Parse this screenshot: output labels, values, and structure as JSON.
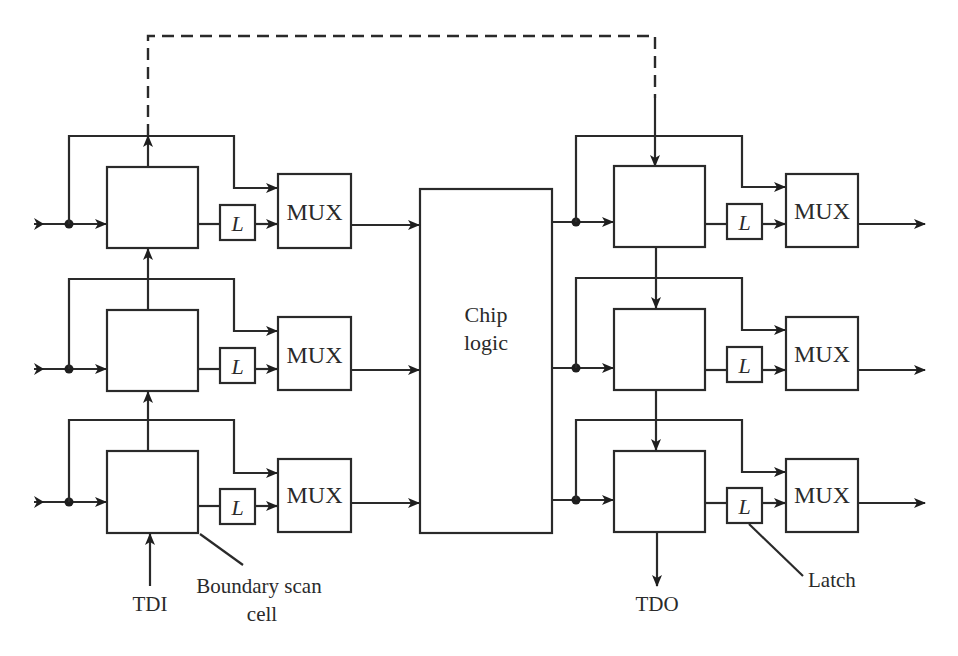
{
  "diagram": {
    "chip_logic": {
      "line1": "Chip",
      "line2": "logic"
    },
    "mux_label": "MUX",
    "latch_label": "L",
    "annotations": {
      "tdi": "TDI",
      "tdo": "TDO",
      "boundary_scan_line1": "Boundary scan",
      "boundary_scan_line2": "cell",
      "latch": "Latch"
    },
    "left_rows": [
      {
        "mux": "MUX",
        "latch": "L"
      },
      {
        "mux": "MUX",
        "latch": "L"
      },
      {
        "mux": "MUX",
        "latch": "L"
      }
    ],
    "right_rows": [
      {
        "mux": "MUX",
        "latch": "L"
      },
      {
        "mux": "MUX",
        "latch": "L"
      },
      {
        "mux": "MUX",
        "latch": "L"
      }
    ],
    "colors": {
      "line": "#2a2a2a",
      "background": "#ffffff"
    }
  }
}
